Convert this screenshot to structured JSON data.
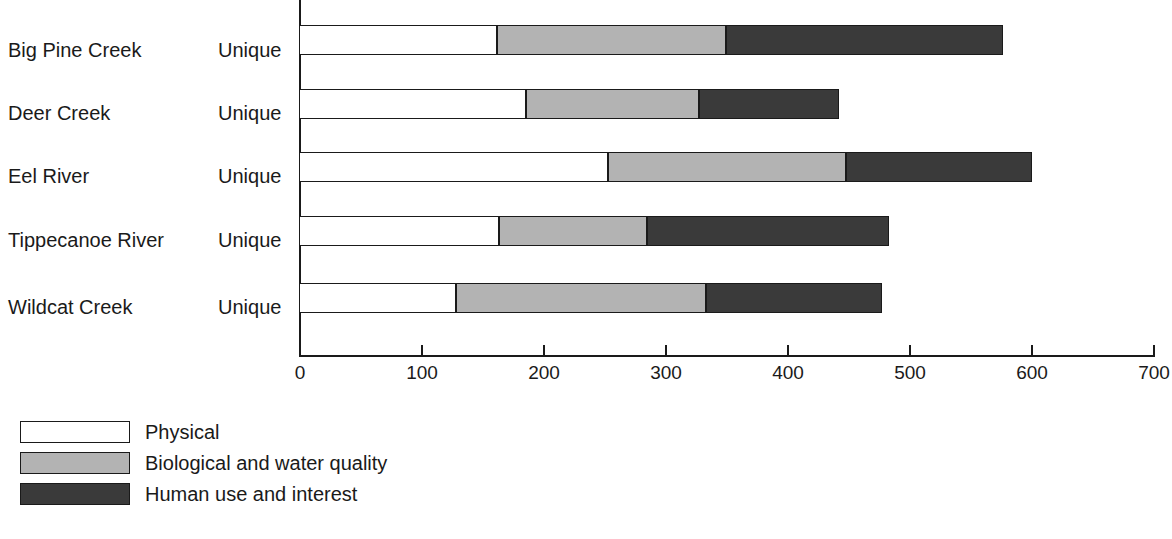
{
  "chart_data": {
    "type": "bar",
    "orientation": "horizontal",
    "stacked": true,
    "title": "",
    "xlabel": "",
    "ylabel": "",
    "xlim": [
      0,
      700
    ],
    "grid": false,
    "legend_position": "below-left",
    "categories": [
      "Big Pine Creek",
      "Deer Creek",
      "Eel River",
      "Tippecanoe River",
      "Wildcat Creek"
    ],
    "category_sublabels": [
      "Unique",
      "Unique",
      "Unique",
      "Unique",
      "Unique"
    ],
    "xticks": [
      0,
      100,
      200,
      300,
      400,
      500,
      600,
      700
    ],
    "xtick_labels": [
      "0",
      "100",
      "200",
      "300",
      "400",
      "500",
      "600",
      "700"
    ],
    "series": [
      {
        "name": "Physical",
        "color": "#ffffff",
        "values": [
          162,
          186,
          253,
          164,
          129
        ]
      },
      {
        "name": "Biological and water quality",
        "color": "#b3b3b3",
        "values": [
          188,
          142,
          195,
          121,
          205
        ]
      },
      {
        "name": "Human use and interest",
        "color": "#3a3a3a",
        "values": [
          227,
          115,
          153,
          199,
          144
        ]
      }
    ],
    "totals": [
      577,
      443,
      601,
      484,
      478
    ]
  },
  "legend": {
    "items": [
      {
        "label": "Physical",
        "swatch": "legend-swatch-physical"
      },
      {
        "label": "Biological and water quality",
        "swatch": "legend-swatch-biological"
      },
      {
        "label": "Human use and interest",
        "swatch": "legend-swatch-human"
      }
    ]
  },
  "caption": {
    "text": ""
  },
  "colors": {
    "axis": "#1a1a1a",
    "text": "#1a1a1a",
    "physical": "#ffffff",
    "biological": "#b3b3b3",
    "human": "#3a3a3a"
  }
}
